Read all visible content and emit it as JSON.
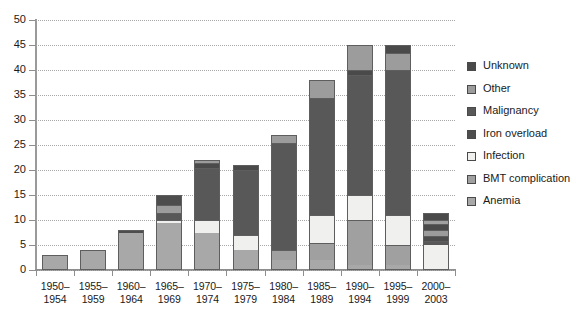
{
  "chart_data": {
    "type": "bar",
    "subtype": "stacked-bar",
    "title": "",
    "xlabel": "",
    "ylabel": "",
    "ylim": [
      0,
      50
    ],
    "yticks": [
      0,
      5,
      10,
      15,
      20,
      25,
      30,
      35,
      40,
      45,
      50
    ],
    "ytick_labels": [
      "0",
      "5",
      "10",
      "15",
      "20",
      "25",
      "30",
      "35",
      "40",
      "45",
      "50"
    ],
    "grid": true,
    "grid_style": "dotted-horizontal",
    "legend_position": "right",
    "categories": [
      "1950–1954",
      "1955–1959",
      "1960–1964",
      "1965–1969",
      "1970–1974",
      "1975–1979",
      "1980–1984",
      "1985–1989",
      "1990–1994",
      "1995–1999",
      "2000–2003"
    ],
    "category_lines": [
      [
        "1950–",
        "1954"
      ],
      [
        "1955–",
        "1959"
      ],
      [
        "1960–",
        "1964"
      ],
      [
        "1965–",
        "1969"
      ],
      [
        "1970–",
        "1974"
      ],
      [
        "1975–",
        "1979"
      ],
      [
        "1980–",
        "1984"
      ],
      [
        "1985–",
        "1989"
      ],
      [
        "1990–",
        "1994"
      ],
      [
        "1995–",
        "1999"
      ],
      [
        "2000–",
        "2003"
      ]
    ],
    "series": [
      {
        "name": "Anemia",
        "color": "#a8a8a8",
        "values": [
          3,
          4,
          7.5,
          9.5,
          7.5,
          4,
          2,
          2,
          1,
          1,
          0
        ]
      },
      {
        "name": "BMT complication",
        "color": "#a0a0a0",
        "values": [
          0,
          0,
          0,
          0,
          0,
          0,
          2,
          3.5,
          9,
          4,
          0
        ]
      },
      {
        "name": "Infection",
        "color": "#f0f0ee",
        "values": [
          0,
          0,
          0,
          0.5,
          2.5,
          3,
          0,
          5.5,
          5,
          6,
          5
        ]
      },
      {
        "name": "Iron overload",
        "color": "#4d4d4d",
        "values": [
          0,
          0,
          0.5,
          2,
          0,
          0,
          0,
          0,
          0,
          0,
          1
        ]
      },
      {
        "name": "Malignancy",
        "color": "#585858",
        "values": [
          0,
          0,
          0,
          1.5,
          10.5,
          13,
          21.5,
          23.5,
          24,
          29,
          0.8
        ]
      },
      {
        "name": "Other",
        "color": "#9c9c9c",
        "values": [
          0,
          0,
          0,
          1.5,
          0.5,
          0,
          0,
          0,
          0,
          0,
          1.2
        ]
      },
      {
        "name": "Unknown",
        "color": "#4a4a4a",
        "values": [
          0,
          0,
          0,
          0,
          1,
          1,
          1.5,
          3.5,
          6,
          5,
          3.5
        ]
      }
    ],
    "totals": [
      3,
      4,
      8,
      15,
      22,
      21,
      27,
      38,
      45,
      45,
      11.5
    ]
  },
  "legend": {
    "items": [
      {
        "label": "Unknown",
        "swatch": "#4a4a4a"
      },
      {
        "label": "Other",
        "swatch": "#9c9c9c"
      },
      {
        "label": "Malignancy",
        "swatch": "#585858"
      },
      {
        "label": "Iron overload",
        "swatch": "#4d4d4d"
      },
      {
        "label": "Infection",
        "swatch": "#f0f0ee"
      },
      {
        "label": "BMT complication",
        "swatch": "#a0a0a0"
      },
      {
        "label": "Anemia",
        "swatch": "#a8a8a8"
      }
    ]
  },
  "bars": [
    {
      "category": "1950–1954",
      "total": 3,
      "segments": [
        {
          "series": "Anemia",
          "value": 3,
          "from": 0,
          "to": 3,
          "color": "#a8a8a8"
        }
      ]
    },
    {
      "category": "1955–1959",
      "total": 4,
      "segments": [
        {
          "series": "Anemia",
          "value": 4,
          "from": 0,
          "to": 4,
          "color": "#a8a8a8"
        }
      ]
    },
    {
      "category": "1960–1964",
      "total": 8,
      "segments": [
        {
          "series": "Anemia",
          "value": 7.5,
          "from": 0,
          "to": 7.5,
          "color": "#a8a8a8"
        },
        {
          "series": "Iron overload",
          "value": 0.5,
          "from": 7.5,
          "to": 8,
          "color": "#4d4d4d"
        }
      ]
    },
    {
      "category": "1965–1969",
      "total": 15,
      "segments": [
        {
          "series": "Anemia",
          "value": 9.5,
          "from": 0,
          "to": 9.5,
          "color": "#a8a8a8"
        },
        {
          "series": "Infection",
          "value": 0.5,
          "from": 9.5,
          "to": 10,
          "color": "#f0f0ee"
        },
        {
          "series": "Malignancy",
          "value": 1.5,
          "from": 10,
          "to": 11.5,
          "color": "#585858"
        },
        {
          "series": "Other",
          "value": 1.5,
          "from": 11.5,
          "to": 13,
          "color": "#9c9c9c"
        },
        {
          "series": "Iron overload",
          "value": 2,
          "from": 13,
          "to": 15,
          "color": "#4d4d4d"
        }
      ]
    },
    {
      "category": "1970–1974",
      "total": 22,
      "segments": [
        {
          "series": "Anemia",
          "value": 7.5,
          "from": 0,
          "to": 7.5,
          "color": "#a8a8a8"
        },
        {
          "series": "Infection",
          "value": 2.5,
          "from": 7.5,
          "to": 10,
          "color": "#f0f0ee"
        },
        {
          "series": "Malignancy",
          "value": 10.5,
          "from": 10,
          "to": 20.5,
          "color": "#585858"
        },
        {
          "series": "Unknown",
          "value": 1,
          "from": 20.5,
          "to": 21.5,
          "color": "#4a4a4a"
        },
        {
          "series": "Other",
          "value": 0.5,
          "from": 21.5,
          "to": 22,
          "color": "#9c9c9c"
        }
      ]
    },
    {
      "category": "1975–1979",
      "total": 21,
      "segments": [
        {
          "series": "Anemia",
          "value": 4,
          "from": 0,
          "to": 4,
          "color": "#a8a8a8"
        },
        {
          "series": "Infection",
          "value": 3,
          "from": 4,
          "to": 7,
          "color": "#f0f0ee"
        },
        {
          "series": "Malignancy",
          "value": 13,
          "from": 7,
          "to": 20,
          "color": "#585858"
        },
        {
          "series": "Unknown",
          "value": 1,
          "from": 20,
          "to": 21,
          "color": "#4a4a4a"
        }
      ]
    },
    {
      "category": "1980–1984",
      "total": 27,
      "segments": [
        {
          "series": "Anemia",
          "value": 2,
          "from": 0,
          "to": 2,
          "color": "#a8a8a8"
        },
        {
          "series": "BMT complication",
          "value": 2,
          "from": 2,
          "to": 4,
          "color": "#a0a0a0"
        },
        {
          "series": "Malignancy",
          "value": 21.5,
          "from": 4,
          "to": 25.5,
          "color": "#585858"
        },
        {
          "series": "Unknown",
          "value": 1.5,
          "from": 25.5,
          "to": 27,
          "color": "#9c9c9c"
        }
      ]
    },
    {
      "category": "1985–1989",
      "total": 38,
      "segments": [
        {
          "series": "Anemia",
          "value": 2,
          "from": 0,
          "to": 2,
          "color": "#a8a8a8"
        },
        {
          "series": "BMT complication",
          "value": 3.5,
          "from": 2,
          "to": 5.5,
          "color": "#a0a0a0"
        },
        {
          "series": "Infection",
          "value": 5.5,
          "from": 5.5,
          "to": 11,
          "color": "#f0f0ee"
        },
        {
          "series": "Malignancy",
          "value": 23.5,
          "from": 11,
          "to": 34.5,
          "color": "#585858"
        },
        {
          "series": "Other",
          "value": 3.5,
          "from": 34.5,
          "to": 38,
          "color": "#9c9c9c"
        }
      ]
    },
    {
      "category": "1990–1994",
      "total": 45,
      "segments": [
        {
          "series": "Anemia",
          "value": 1,
          "from": 0,
          "to": 1,
          "color": "#a8a8a8"
        },
        {
          "series": "BMT complication",
          "value": 9,
          "from": 1,
          "to": 10,
          "color": "#a0a0a0"
        },
        {
          "series": "Infection",
          "value": 5,
          "from": 10,
          "to": 15,
          "color": "#f0f0ee"
        },
        {
          "series": "Malignancy",
          "value": 24,
          "from": 15,
          "to": 39,
          "color": "#585858"
        },
        {
          "series": "Unknown",
          "value": 1,
          "from": 39,
          "to": 40,
          "color": "#4a4a4a"
        },
        {
          "series": "Other",
          "value": 5,
          "from": 40,
          "to": 45,
          "color": "#9c9c9c"
        }
      ]
    },
    {
      "category": "1995–1999",
      "total": 45,
      "segments": [
        {
          "series": "Anemia",
          "value": 1,
          "from": 0,
          "to": 1,
          "color": "#a8a8a8"
        },
        {
          "series": "BMT complication",
          "value": 4,
          "from": 1,
          "to": 5,
          "color": "#a0a0a0"
        },
        {
          "series": "Infection",
          "value": 6,
          "from": 5,
          "to": 11,
          "color": "#f0f0ee"
        },
        {
          "series": "Malignancy",
          "value": 29,
          "from": 11,
          "to": 40,
          "color": "#585858"
        },
        {
          "series": "Other",
          "value": 3.5,
          "from": 40,
          "to": 43.5,
          "color": "#9c9c9c"
        },
        {
          "series": "Unknown",
          "value": 1.5,
          "from": 43.5,
          "to": 45,
          "color": "#4a4a4a"
        }
      ]
    },
    {
      "category": "2000–2003",
      "total": 11.5,
      "segments": [
        {
          "series": "Infection",
          "value": 5,
          "from": 0,
          "to": 5,
          "color": "#f0f0ee"
        },
        {
          "series": "Malignancy",
          "value": 0.8,
          "from": 5,
          "to": 5.8,
          "color": "#585858"
        },
        {
          "series": "Iron overload",
          "value": 1,
          "from": 5.8,
          "to": 6.8,
          "color": "#4d4d4d"
        },
        {
          "series": "Other",
          "value": 1.2,
          "from": 6.8,
          "to": 8,
          "color": "#9c9c9c"
        },
        {
          "series": "Unknown",
          "value": 1.2,
          "from": 8,
          "to": 9.2,
          "color": "#4a4a4a"
        },
        {
          "series": "BMT complication",
          "value": 0.8,
          "from": 9.2,
          "to": 10,
          "color": "#a0a0a0"
        },
        {
          "series": "Unknown",
          "value": 1.5,
          "from": 10,
          "to": 11.5,
          "color": "#4a4a4a"
        }
      ]
    }
  ]
}
